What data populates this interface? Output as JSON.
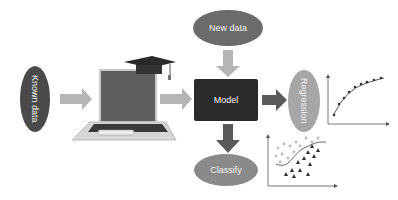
{
  "diagram": {
    "nodes": {
      "known_data": {
        "label": "Known data",
        "color": "#4a4a4a"
      },
      "new_data": {
        "label": "New data",
        "color": "#6b6b6b"
      },
      "model": {
        "label": "Model",
        "color": "#2a2a2a"
      },
      "regression": {
        "label": "Regression",
        "color": "#a6a6a6"
      },
      "classify": {
        "label": "Classify",
        "color": "#8a8a8a"
      }
    },
    "edges": [
      {
        "from": "known_data",
        "to": "training-laptop"
      },
      {
        "from": "training-laptop",
        "to": "model"
      },
      {
        "from": "new_data",
        "to": "model"
      },
      {
        "from": "model",
        "to": "regression"
      },
      {
        "from": "model",
        "to": "classify"
      }
    ],
    "colors": {
      "arrow_light": "#b5b5b5",
      "arrow_dark": "#5a5a5a"
    }
  }
}
